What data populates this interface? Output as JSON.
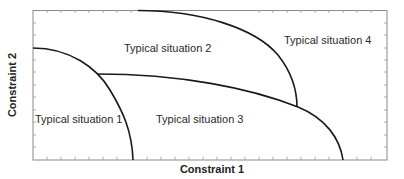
{
  "diagram": {
    "xlabel": "Constraint 1",
    "ylabel": "Constraint 2",
    "regions": [
      {
        "label": "Typical situation 1"
      },
      {
        "label": "Typical situation 2"
      },
      {
        "label": "Typical situation 3"
      },
      {
        "label": "Typical situation 4"
      }
    ],
    "colors": {
      "curve": "#1a1a1a",
      "frame": "#777777",
      "text": "#2a2a2a"
    }
  }
}
